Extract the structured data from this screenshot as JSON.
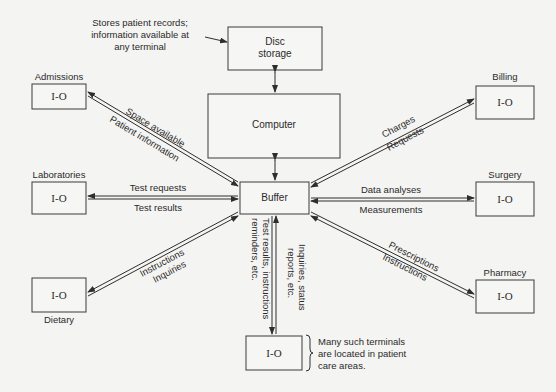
{
  "diagram": {
    "type": "hospital-information-system-block-diagram",
    "nodes": {
      "disc_storage": {
        "label_line1": "Disc",
        "label_line2": "storage"
      },
      "computer": {
        "label": "Computer"
      },
      "buffer": {
        "label": "Buffer"
      },
      "admissions": {
        "box_label": "I-O",
        "name": "Admissions"
      },
      "laboratories": {
        "box_label": "I-O",
        "name": "Laboratories"
      },
      "dietary": {
        "box_label": "I-O",
        "name": "Dietary"
      },
      "billing": {
        "box_label": "I-O",
        "name": "Billing"
      },
      "surgery": {
        "box_label": "I-O",
        "name": "Surgery"
      },
      "pharmacy": {
        "box_label": "I-O",
        "name": "Pharmacy"
      },
      "patient_terminal": {
        "box_label": "I-O"
      }
    },
    "annotations": {
      "disc_note": [
        "Stores patient records;",
        "information available at",
        "any terminal"
      ],
      "terminal_note": [
        "Many such terminals",
        "are located in patient",
        "care areas."
      ]
    },
    "edges": {
      "admissions": {
        "upper": "Space available",
        "lower": "Patient information"
      },
      "laboratories": {
        "upper": "Test requests",
        "lower": "Test results"
      },
      "dietary": {
        "upper": "Instructions",
        "lower": "Inquiries"
      },
      "billing": {
        "upper": "Charges",
        "lower": "Requests"
      },
      "surgery": {
        "upper": "Data analyses",
        "lower": "Measurements"
      },
      "pharmacy": {
        "upper": "Prescriptions",
        "lower": "Instructions"
      },
      "terminal_down": [
        "Test results, instructions",
        "reminders, etc."
      ],
      "terminal_up": [
        "Inquiries, status",
        "reports, etc."
      ]
    }
  }
}
